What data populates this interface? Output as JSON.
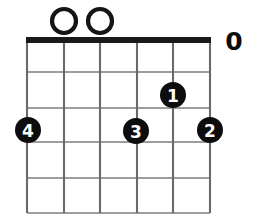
{
  "diagram": {
    "type": "guitar-chord-diagram",
    "grid": {
      "left": 27,
      "right": 210,
      "top": 40,
      "bottom": 213,
      "string_count": 6,
      "fret_count": 5,
      "string_x": [
        27,
        64,
        100,
        137,
        173,
        210
      ],
      "fret_y": [
        40,
        72,
        108,
        142,
        178,
        213
      ],
      "nut_y": 40,
      "nut_thickness": 6,
      "grid_color": "#7d7d7d",
      "string_color": "#6a6a6a",
      "nut_color": "#1a1a1a"
    },
    "open_string_markers": [
      {
        "label": "O",
        "string_index": 1,
        "cx": 64,
        "cy": 21,
        "r": 12,
        "style": "circle",
        "color": "#151515"
      },
      {
        "label": "O",
        "string_index": 2,
        "cx": 100,
        "cy": 21,
        "r": 12,
        "style": "circle",
        "color": "#151515"
      }
    ],
    "side_markers": [
      {
        "label": "0",
        "x": 234,
        "y": 41,
        "color": "#0d0d0d"
      }
    ],
    "finger_dots": [
      {
        "label": "1",
        "finger": 1,
        "string_index": 4,
        "fret": 2,
        "cx": 173,
        "cy": 95,
        "r": 13,
        "color": "#0d0d0d",
        "text_color": "#ffffff"
      },
      {
        "label": "4",
        "finger": 4,
        "string_index": 0,
        "fret": 3,
        "cx": 28,
        "cy": 130,
        "r": 13,
        "color": "#0d0d0d",
        "text_color": "#ffffff"
      },
      {
        "label": "3",
        "finger": 3,
        "string_index": 3,
        "fret": 3,
        "cx": 136,
        "cy": 131,
        "r": 13,
        "color": "#0d0d0d",
        "text_color": "#ffffff"
      },
      {
        "label": "2",
        "finger": 2,
        "string_index": 5,
        "fret": 3,
        "cx": 210,
        "cy": 130,
        "r": 13,
        "color": "#0d0d0d",
        "text_color": "#ffffff"
      }
    ]
  }
}
